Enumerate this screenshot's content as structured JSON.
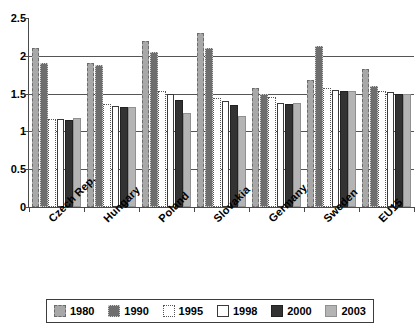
{
  "chart_data": {
    "type": "bar",
    "title": "",
    "subtitle": "",
    "xlabel": "",
    "ylabel": "",
    "ylim": [
      0,
      2.5
    ],
    "yticks": [
      "0",
      "0.5",
      "1",
      "1.5",
      "2",
      "2.5"
    ],
    "ytick_values": [
      0,
      0.5,
      1,
      1.5,
      2,
      2.5
    ],
    "grid": true,
    "grid_axis": "y",
    "legend_position": "bottom",
    "categories": [
      "Czech Rep.",
      "Hungary",
      "Poland",
      "Slovakia",
      "Germany",
      "Sweden",
      "EU15"
    ],
    "series": [
      {
        "name": "1980",
        "values": [
          2.1,
          1.9,
          2.2,
          2.3,
          1.57,
          1.68,
          1.83
        ]
      },
      {
        "name": "1990",
        "values": [
          1.9,
          1.88,
          2.05,
          2.1,
          1.5,
          2.13,
          1.6
        ]
      },
      {
        "name": "1995",
        "values": [
          1.17,
          1.36,
          1.53,
          1.44,
          1.45,
          1.58,
          1.54
        ]
      },
      {
        "name": "1998",
        "values": [
          1.17,
          1.33,
          1.5,
          1.4,
          1.37,
          1.55,
          1.52
        ]
      },
      {
        "name": "2000",
        "values": [
          1.15,
          1.32,
          1.42,
          1.35,
          1.36,
          1.53,
          1.5
        ]
      },
      {
        "name": "2003",
        "values": [
          1.18,
          1.32,
          1.25,
          1.2,
          1.37,
          1.53,
          1.5
        ]
      }
    ],
    "series_colors": [
      "#a8a8a8",
      "#6e6e6e",
      "#ffffff",
      "#ffffff",
      "#333333",
      "#b4b4b4"
    ]
  },
  "legend": {
    "items": [
      {
        "label": "1980",
        "swatch": "legend-swatch-1980"
      },
      {
        "label": "1990",
        "swatch": "legend-swatch-1990"
      },
      {
        "label": "1995",
        "swatch": "legend-swatch-1995"
      },
      {
        "label": "1998",
        "swatch": "legend-swatch-1998"
      },
      {
        "label": "2000",
        "swatch": "legend-swatch-2000"
      },
      {
        "label": "2003",
        "swatch": "legend-swatch-2003"
      }
    ]
  }
}
